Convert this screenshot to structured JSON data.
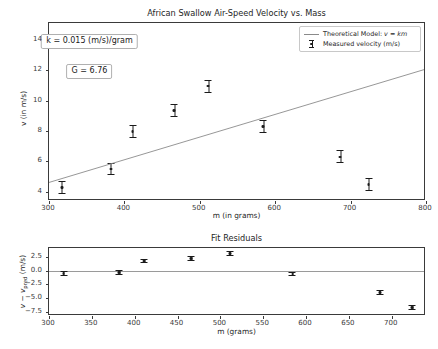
{
  "figure": {
    "width": 438,
    "height": 349,
    "background": "#ffffff",
    "foreground": "#262626"
  },
  "chart_data": [
    {
      "type": "scatter",
      "id": "main",
      "title": "African Swallow Air-Speed Velocity vs. Mass",
      "xlabel": "m (in grams)",
      "ylabel": "v (in m/s)",
      "xlim": [
        300,
        800
      ],
      "ylim": [
        3.4,
        15.1
      ],
      "xticks": [
        300,
        400,
        500,
        600,
        700,
        800
      ],
      "xticklabels": [
        "300",
        "400",
        "500",
        "600",
        "700",
        "800"
      ],
      "yticks": [
        4,
        6,
        8,
        10,
        12,
        14
      ],
      "yticklabels": [
        "4",
        "6",
        "8",
        "10",
        "12",
        "14"
      ],
      "grid": false,
      "legend_position": "upper right",
      "series": [
        {
          "name": "Measured velocity (m/s)",
          "type": "errorbar",
          "marker": "point-with-errorbars",
          "color": "#1a1a1a",
          "x": [
            317,
            382,
            411,
            466,
            511,
            584,
            686,
            724
          ],
          "y": [
            4.3,
            5.5,
            7.95,
            9.35,
            10.95,
            8.3,
            6.3,
            4.5
          ],
          "yerr": [
            0.42,
            0.42,
            0.42,
            0.42,
            0.42,
            0.42,
            0.42,
            0.42
          ]
        },
        {
          "name": "Theoretical Model: v = km",
          "type": "line",
          "color": "#8a8a8a",
          "equation": "v = km",
          "slope": 0.015,
          "x": [
            300,
            800
          ],
          "y": [
            4.5,
            12.0
          ]
        }
      ],
      "annotations": [
        {
          "id": "k-value",
          "text": "k = 0.015 (m/s)/gram",
          "x": 355,
          "y": 13.9
        },
        {
          "id": "g-value",
          "text": "G = 6.76",
          "x": 355,
          "y": 11.95
        }
      ]
    },
    {
      "type": "scatter",
      "id": "residuals",
      "title": "Fit Residuals",
      "xlabel": "m (grams)",
      "ylabel": "v − v_pred (m/s)",
      "ylabel_parts": {
        "main": "v − v",
        "subscript": "pred",
        "units": " (m/s)"
      },
      "xlim": [
        300,
        740
      ],
      "ylim": [
        -8.3,
        4.2
      ],
      "xticks": [
        300,
        350,
        400,
        450,
        500,
        550,
        600,
        650,
        700
      ],
      "xticklabels": [
        "300",
        "350",
        "400",
        "450",
        "500",
        "550",
        "600",
        "650",
        "700"
      ],
      "yticks": [
        2.5,
        0.0,
        -2.5,
        -5.0,
        -7.5
      ],
      "yticklabels": [
        "2.5",
        "0.0",
        "−2.5",
        "−5.0",
        "−7.5"
      ],
      "grid": false,
      "zero_line": {
        "value": 0.0,
        "color": "#9a9a9a"
      },
      "series": [
        {
          "name": "residuals",
          "type": "errorbar",
          "color": "#1a1a1a",
          "x": [
            317,
            382,
            411,
            466,
            511,
            584,
            686,
            724
          ],
          "y": [
            -0.5,
            -0.3,
            1.8,
            2.3,
            3.2,
            -0.6,
            -4.0,
            -6.7
          ],
          "yerr": [
            0.42,
            0.42,
            0.42,
            0.42,
            0.42,
            0.42,
            0.42,
            0.42
          ]
        }
      ]
    }
  ],
  "legend": {
    "items": [
      {
        "key": "line",
        "label_pre": "Theoretical Model: ",
        "label_math_v": "v",
        "label_eq": " = ",
        "label_math_km": "km"
      },
      {
        "key": "errorbar",
        "label": "Measured velocity (m/s)"
      }
    ]
  }
}
